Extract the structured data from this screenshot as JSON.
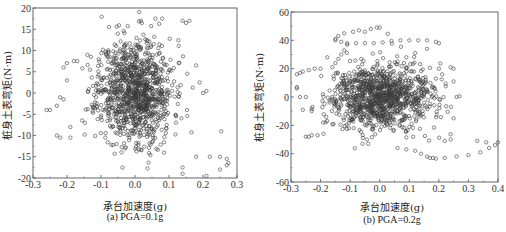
{
  "figure": {
    "panels": [
      {
        "caption": "(a) PGA=0.1g",
        "xlabel": "承台加速度(g)",
        "ylabel": "桩身土表弯矩(N·m)"
      },
      {
        "caption": "(b) PGA=0.2g",
        "xlabel": "承台加速度(g)",
        "ylabel": "桩身土表弯矩(N·m)"
      }
    ]
  },
  "chart_data": [
    {
      "type": "scatter",
      "title": "(a) PGA=0.1g",
      "xlabel": "承台加速度(g)",
      "ylabel": "桩身土表弯矩(N·m)",
      "xlim": [
        -0.3,
        0.3
      ],
      "ylim": [
        -20,
        20
      ],
      "xticks": [
        -0.3,
        -0.2,
        -0.1,
        0.0,
        0.1,
        0.2,
        0.3
      ],
      "xtick_labels": [
        "-0.3",
        "-0.2",
        "-0.1",
        "0.0",
        "0.1",
        "0.2",
        "0.3"
      ],
      "yticks": [
        -20,
        -15,
        -10,
        -5,
        0,
        5,
        10,
        15,
        20
      ],
      "ytick_labels": [
        "-20",
        "-15",
        "-10",
        "-5",
        "0",
        "5",
        "10",
        "15",
        "20"
      ],
      "grid": false,
      "legend": null,
      "marker": "open-circle",
      "box": {
        "left": 33,
        "top": 8,
        "right": 237,
        "bottom": 178
      },
      "cloud": {
        "count": 1100,
        "cx": 0.0,
        "cy": 0.5,
        "sx": 0.055,
        "sy": 6.0,
        "seed": 11
      },
      "notable_points": [
        [
          -0.26,
          -4
        ],
        [
          -0.25,
          -4
        ],
        [
          -0.23,
          -3
        ],
        [
          -0.22,
          -1
        ],
        [
          -0.21,
          -1.5
        ],
        [
          -0.23,
          -10
        ],
        [
          -0.22,
          -10.5
        ],
        [
          -0.19,
          -10.5
        ],
        [
          -0.19,
          -8
        ],
        [
          -0.21,
          6
        ],
        [
          -0.2,
          7
        ],
        [
          -0.18,
          7.5
        ],
        [
          -0.17,
          7.5
        ],
        [
          -0.2,
          3
        ],
        [
          -0.14,
          9
        ],
        [
          -0.13,
          8.5
        ],
        [
          0.14,
          17
        ],
        [
          0.15,
          16.5
        ],
        [
          0.16,
          17
        ],
        [
          0.06,
          17.5
        ],
        [
          0.08,
          17.5
        ],
        [
          0.02,
          16.5
        ],
        [
          0.18,
          -15
        ],
        [
          0.22,
          -15
        ],
        [
          0.25,
          -15
        ],
        [
          0.27,
          -15.5
        ],
        [
          0.275,
          -16.5
        ],
        [
          0.27,
          -17
        ],
        [
          0.25,
          -18
        ],
        [
          0.21,
          -19.5
        ],
        [
          0.14,
          -19
        ],
        [
          0.14,
          -17.5
        ],
        [
          0.19,
          2.5
        ],
        [
          0.21,
          0.5
        ],
        [
          0.2,
          0
        ],
        [
          0.18,
          6.5
        ]
      ]
    },
    {
      "type": "scatter",
      "title": "(b) PGA=0.2g",
      "xlabel": "承台加速度(g)",
      "ylabel": "桩身土表弯矩(N·m)",
      "xlim": [
        -0.3,
        0.4
      ],
      "ylim": [
        -60,
        60
      ],
      "xticks": [
        -0.3,
        -0.2,
        -0.1,
        0.0,
        0.1,
        0.2,
        0.3,
        0.4
      ],
      "xtick_labels": [
        "-0.3",
        "-0.2",
        "-0.1",
        "0.0",
        "0.1",
        "0.2",
        "0.3",
        "0.4"
      ],
      "yticks": [
        -60,
        -40,
        -20,
        0,
        20,
        40,
        60
      ],
      "ytick_labels": [
        "-60",
        "-40",
        "-20",
        "0",
        "20",
        "40",
        "60"
      ],
      "grid": false,
      "legend": null,
      "marker": "open-circle",
      "box": {
        "left": 291,
        "top": 12,
        "right": 498,
        "bottom": 182
      },
      "cloud": {
        "count": 1100,
        "cx": 0.0,
        "cy": 0.0,
        "sx": 0.085,
        "sy": 11.0,
        "seed": 29
      },
      "notable_points": [
        [
          -0.15,
          41
        ],
        [
          -0.14,
          43
        ],
        [
          -0.12,
          45
        ],
        [
          -0.09,
          46
        ],
        [
          -0.07,
          47
        ],
        [
          -0.05,
          46
        ],
        [
          -0.03,
          48
        ],
        [
          -0.01,
          49
        ],
        [
          0.0,
          49
        ],
        [
          -0.15,
          40
        ],
        [
          -0.13,
          39
        ],
        [
          -0.11,
          38
        ],
        [
          -0.08,
          38
        ],
        [
          -0.05,
          38
        ],
        [
          -0.02,
          38
        ],
        [
          0.01,
          38.5
        ],
        [
          0.04,
          39.5
        ],
        [
          0.07,
          40
        ],
        [
          0.1,
          40
        ],
        [
          0.13,
          40
        ],
        [
          0.16,
          40
        ],
        [
          0.19,
          39
        ],
        [
          0.2,
          38
        ],
        [
          -0.11,
          37
        ],
        [
          -0.12,
          33
        ],
        [
          -0.13,
          30
        ],
        [
          -0.14,
          27
        ],
        [
          -0.15,
          24
        ],
        [
          -0.16,
          21
        ],
        [
          0.12,
          31
        ],
        [
          0.16,
          34
        ],
        [
          0.09,
          28
        ],
        [
          0.06,
          25
        ],
        [
          -0.28,
          16
        ],
        [
          -0.27,
          17
        ],
        [
          -0.26,
          18
        ],
        [
          -0.24,
          19
        ],
        [
          -0.22,
          20
        ],
        [
          -0.2,
          20
        ],
        [
          -0.28,
          6
        ],
        [
          -0.28,
          7
        ],
        [
          -0.27,
          0
        ],
        [
          -0.25,
          0
        ],
        [
          -0.26,
          -9
        ],
        [
          -0.25,
          -28
        ],
        [
          -0.24,
          -28
        ],
        [
          -0.23,
          -27
        ],
        [
          -0.21,
          -27
        ],
        [
          -0.19,
          -26
        ],
        [
          0.06,
          -36
        ],
        [
          0.09,
          -37
        ],
        [
          0.12,
          -38
        ],
        [
          0.14,
          -40
        ],
        [
          0.16,
          -42
        ],
        [
          0.17,
          -43
        ],
        [
          0.18,
          -43
        ],
        [
          0.19,
          -43.5
        ],
        [
          0.22,
          -43
        ],
        [
          0.26,
          -42
        ],
        [
          0.3,
          -41
        ],
        [
          0.34,
          -39
        ],
        [
          0.37,
          -36
        ],
        [
          0.39,
          -34
        ],
        [
          0.4,
          -32
        ],
        [
          0.33,
          -31
        ],
        [
          0.36,
          -32
        ],
        [
          0.24,
          21
        ],
        [
          0.25,
          20
        ],
        [
          0.25,
          11
        ],
        [
          0.26,
          0
        ],
        [
          0.27,
          0.5
        ],
        [
          0.25,
          -15
        ],
        [
          0.24,
          -30
        ],
        [
          0.22,
          -31
        ],
        [
          0.2,
          20
        ],
        [
          0.19,
          13
        ]
      ]
    }
  ]
}
